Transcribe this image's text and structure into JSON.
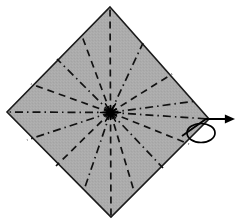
{
  "figure": {
    "title": "Origami crease pattern — square with radial folds and turn-over symbol",
    "width": 237,
    "height": 222,
    "background_color": "#ffffff",
    "alt_text": "A gray square rotated 45 degrees into a diamond, marked with twelve radiating crease lines meeting at the center; alternating dashed valley folds and dash-dot mountain folds. To the right of the diamond is a turn-over arrow symbol: a straight arrow pointing right with a small ellipse loop beneath it."
  },
  "sheet": {
    "name": "paper-square",
    "fill_color": "#ababab",
    "stroke_color": "#1a1a1a",
    "stroke_width": 1.6,
    "shape": "diamond",
    "vertices": [
      {
        "id": "top",
        "label": "top corner",
        "x": 110,
        "y": 7
      },
      {
        "id": "right",
        "label": "right corner",
        "x": 209,
        "y": 119
      },
      {
        "id": "bottom",
        "label": "bottom corner",
        "x": 111,
        "y": 217
      },
      {
        "id": "left",
        "label": "left corner",
        "x": 7,
        "y": 112
      }
    ],
    "center": {
      "x": 110.5,
      "y": 112.5
    }
  },
  "legend": {
    "valley_fold": {
      "label": "valley fold",
      "style": "dashed",
      "dash_array": "7 5",
      "color": "#111111",
      "width": 1.7
    },
    "mountain_fold": {
      "label": "mountain fold",
      "style": "dash-dot",
      "dash_array": "8 4 1.5 4",
      "color": "#111111",
      "width": 1.7
    }
  },
  "creases": {
    "count": 12,
    "description": "Twelve crease lines radiate from the center of the square at 30-degree intervals of screen angle, alternating mountain and valley folds.",
    "lines": [
      {
        "id": "crease-n",
        "label": "vertical crease up",
        "fold": "valley",
        "angle_deg": 270,
        "end": {
          "x": 110,
          "y": 7
        }
      },
      {
        "id": "crease-nne",
        "label": "upper-right crease A",
        "fold": "mountain",
        "angle_deg": 300,
        "end": {
          "x": 143,
          "y": 43
        }
      },
      {
        "id": "crease-ne",
        "label": "upper-right crease B",
        "fold": "valley",
        "angle_deg": 323,
        "end": {
          "x": 172,
          "y": 74
        }
      },
      {
        "id": "crease-ene",
        "label": "upper-right crease C",
        "fold": "mountain",
        "angle_deg": 341,
        "end": {
          "x": 196,
          "y": 101
        }
      },
      {
        "id": "crease-e",
        "label": "horizontal crease right",
        "fold": "mountain",
        "angle_deg": 0,
        "end": {
          "x": 209,
          "y": 119
        }
      },
      {
        "id": "crease-ese",
        "label": "lower-right crease C",
        "fold": "valley",
        "angle_deg": 20,
        "end": {
          "x": 189,
          "y": 144
        }
      },
      {
        "id": "crease-se",
        "label": "lower-right crease B",
        "fold": "mountain",
        "angle_deg": 40,
        "end": {
          "x": 163,
          "y": 168
        }
      },
      {
        "id": "crease-sse",
        "label": "lower-right crease A",
        "fold": "valley",
        "angle_deg": 62,
        "end": {
          "x": 134,
          "y": 191
        }
      },
      {
        "id": "crease-s",
        "label": "vertical crease down",
        "fold": "valley",
        "angle_deg": 90,
        "end": {
          "x": 111,
          "y": 217
        }
      },
      {
        "id": "crease-ssw",
        "label": "lower-left crease A",
        "fold": "mountain",
        "angle_deg": 118,
        "end": {
          "x": 84,
          "y": 190
        }
      },
      {
        "id": "crease-sw",
        "label": "lower-left crease B",
        "fold": "valley",
        "angle_deg": 140,
        "end": {
          "x": 56,
          "y": 166
        }
      },
      {
        "id": "crease-wsw",
        "label": "lower-left crease C",
        "fold": "mountain",
        "angle_deg": 160,
        "end": {
          "x": 27,
          "y": 140
        }
      },
      {
        "id": "crease-w",
        "label": "horizontal crease left",
        "fold": "mountain",
        "angle_deg": 180,
        "end": {
          "x": 7,
          "y": 112
        }
      },
      {
        "id": "crease-wnw",
        "label": "upper-left crease C",
        "fold": "valley",
        "angle_deg": 200,
        "end": {
          "x": 31,
          "y": 84
        }
      },
      {
        "id": "crease-nw",
        "label": "upper-left crease B",
        "fold": "mountain",
        "angle_deg": 220,
        "end": {
          "x": 57,
          "y": 59
        }
      },
      {
        "id": "crease-nnw",
        "label": "upper-left crease A",
        "fold": "valley",
        "angle_deg": 242,
        "end": {
          "x": 82,
          "y": 36
        }
      }
    ]
  },
  "center_marker": {
    "name": "crease-convergence-point",
    "label": "center point where all creases meet",
    "x": 110.5,
    "y": 112.5,
    "radius": 4.5,
    "color": "#000000"
  },
  "turn_over_symbol": {
    "name": "turn-over-arrow",
    "label": "turn over / flip the model",
    "color": "#000000",
    "stroke_width": 1.8,
    "arrow": {
      "label": "flip arrow",
      "path_points": [
        {
          "x": 182,
          "y": 136
        },
        {
          "x": 206,
          "y": 119
        },
        {
          "x": 232,
          "y": 119
        }
      ],
      "head": {
        "x": 235,
        "y": 119,
        "size": 7,
        "label": "arrowhead pointing right"
      }
    },
    "loop": {
      "label": "rotation loop ellipse",
      "cx": 201,
      "cy": 133,
      "rx": 14,
      "ry": 9.5,
      "fill": "none"
    }
  }
}
